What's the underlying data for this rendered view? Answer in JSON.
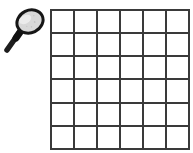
{
  "scene": {
    "background_color": "#ffffff"
  },
  "magnifier": {
    "icon": "magnifying-glass-icon",
    "lens_fill": "#d8d8d8",
    "lens_highlight": "#eeeeee",
    "rim_color": "#161616",
    "handle_color": "#1e1e1e"
  },
  "grid": {
    "rows": 6,
    "cols": 6,
    "line_color": "#3a3a3a",
    "cell_color": "#ffffff"
  }
}
